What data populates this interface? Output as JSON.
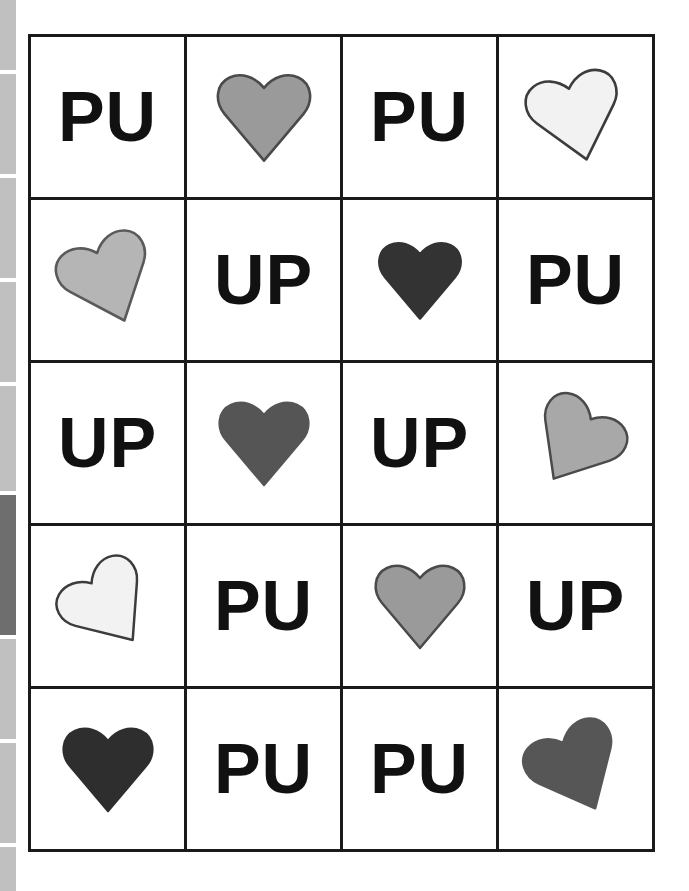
{
  "document": {
    "title": "Hearts and Letters Grid Worksheet",
    "background_color": "#ffffff",
    "border_color": "#1a1a1a"
  },
  "page_strip": {
    "name": "page-thumbnail-scrollbar",
    "segment_color": "#c0c0c0",
    "active_segment_color": "#6e6e6e",
    "segments": [
      {
        "top": 0,
        "height": 70,
        "active": false
      },
      {
        "top": 74,
        "height": 100,
        "active": false
      },
      {
        "top": 178,
        "height": 100,
        "active": false
      },
      {
        "top": 282,
        "height": 100,
        "active": false
      },
      {
        "top": 386,
        "height": 105,
        "active": false
      },
      {
        "top": 495,
        "height": 140,
        "active": true
      },
      {
        "top": 639,
        "height": 100,
        "active": false
      },
      {
        "top": 743,
        "height": 100,
        "active": false
      },
      {
        "top": 847,
        "height": 44,
        "active": false
      }
    ]
  },
  "grid": {
    "name": "cards-grid",
    "columns": 4,
    "rows": 5,
    "cells": [
      {
        "type": "text",
        "label": "PU"
      },
      {
        "type": "heart",
        "label": "heart",
        "color": "#9a9a9a",
        "outline": "#4a4a4a",
        "rotation": 0,
        "size": 104
      },
      {
        "type": "text",
        "label": "PU"
      },
      {
        "type": "heart",
        "label": "heart",
        "color": "#f2f2f2",
        "outline": "#3c3c3c",
        "rotation": -14,
        "size": 104
      },
      {
        "type": "heart",
        "label": "heart",
        "color": "#b5b5b5",
        "outline": "#5a5a5a",
        "rotation": -22,
        "size": 104
      },
      {
        "type": "text",
        "label": "UP"
      },
      {
        "type": "heart",
        "label": "heart",
        "color": "#333333",
        "outline": "#333333",
        "rotation": 0,
        "size": 92
      },
      {
        "type": "text",
        "label": "PU"
      },
      {
        "type": "text",
        "label": "UP"
      },
      {
        "type": "heart",
        "label": "heart",
        "color": "#555555",
        "outline": "#555555",
        "rotation": 0,
        "size": 100
      },
      {
        "type": "text",
        "label": "UP"
      },
      {
        "type": "heart",
        "label": "heart",
        "color": "#a8a8a8",
        "outline": "#4a4a4a",
        "rotation": 32,
        "size": 100
      },
      {
        "type": "heart",
        "label": "heart",
        "color": "#f2f2f2",
        "outline": "#3c3c3c",
        "rotation": -36,
        "size": 100
      },
      {
        "type": "text",
        "label": "PU"
      },
      {
        "type": "heart",
        "label": "heart",
        "color": "#9a9a9a",
        "outline": "#4a4a4a",
        "rotation": 0,
        "size": 100
      },
      {
        "type": "text",
        "label": "UP"
      },
      {
        "type": "heart",
        "label": "heart",
        "color": "#2e2e2e",
        "outline": "#2e2e2e",
        "rotation": 0,
        "size": 100
      },
      {
        "type": "text",
        "label": "PU"
      },
      {
        "type": "text",
        "label": "PU"
      },
      {
        "type": "heart",
        "label": "heart",
        "color": "#565656",
        "outline": "#565656",
        "rotation": -26,
        "size": 104
      }
    ]
  }
}
